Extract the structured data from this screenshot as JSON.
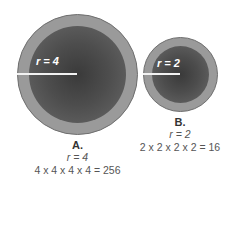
{
  "circles": {
    "a": {
      "radius_label": "r = 4",
      "title": "A.",
      "r_text": "r = 4",
      "equation": "4 x 4 x 4 x 4 = 256"
    },
    "b": {
      "radius_label": "r = 2",
      "title": "B.",
      "r_text": "r = 2",
      "equation": "2 x 2 x 2 x 2 = 16"
    }
  },
  "colors": {
    "outer_ring": "#9a9a9a",
    "inner_core": "#3a3a3a",
    "radius_line": "#f2f2f2"
  }
}
